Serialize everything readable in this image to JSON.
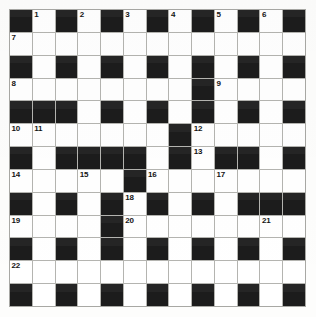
{
  "puzzle": {
    "title": "Crossword Grid",
    "type": "crossword",
    "rows": 13,
    "cols": 13,
    "colors": {
      "block": "#1c1c1c",
      "cell": "#ffffff",
      "grid_line": "#b4b4b0",
      "number": "#141414",
      "page": "#ffffff"
    },
    "legend": {
      "block_label": "blocked square",
      "cell_label": "empty answer square"
    },
    "clue_numbers": [
      1,
      2,
      3,
      4,
      5,
      6,
      7,
      8,
      9,
      10,
      11,
      12,
      13,
      14,
      15,
      16,
      17,
      18,
      19,
      20,
      21,
      22
    ],
    "grid": [
      [
        {
          "block": true
        },
        {
          "block": false,
          "num": "1"
        },
        {
          "block": true
        },
        {
          "block": false,
          "num": "2"
        },
        {
          "block": true
        },
        {
          "block": false,
          "num": "3"
        },
        {
          "block": true
        },
        {
          "block": false,
          "num": "4"
        },
        {
          "block": true
        },
        {
          "block": false,
          "num": "5"
        },
        {
          "block": true
        },
        {
          "block": false,
          "num": "6"
        },
        {
          "block": true
        }
      ],
      [
        {
          "block": false,
          "num": "7"
        },
        {
          "block": false
        },
        {
          "block": false
        },
        {
          "block": false
        },
        {
          "block": false
        },
        {
          "block": false
        },
        {
          "block": false
        },
        {
          "block": false
        },
        {
          "block": false
        },
        {
          "block": false
        },
        {
          "block": false
        },
        {
          "block": false
        },
        {
          "block": false
        }
      ],
      [
        {
          "block": true
        },
        {
          "block": false
        },
        {
          "block": true
        },
        {
          "block": false
        },
        {
          "block": true
        },
        {
          "block": false
        },
        {
          "block": true
        },
        {
          "block": false
        },
        {
          "block": true
        },
        {
          "block": false
        },
        {
          "block": true
        },
        {
          "block": false
        },
        {
          "block": true
        }
      ],
      [
        {
          "block": false,
          "num": "8"
        },
        {
          "block": false
        },
        {
          "block": false
        },
        {
          "block": false
        },
        {
          "block": false
        },
        {
          "block": false
        },
        {
          "block": false
        },
        {
          "block": false
        },
        {
          "block": true
        },
        {
          "block": false,
          "num": "9"
        },
        {
          "block": false
        },
        {
          "block": false
        },
        {
          "block": false
        }
      ],
      [
        {
          "block": true
        },
        {
          "block": true
        },
        {
          "block": true
        },
        {
          "block": false
        },
        {
          "block": true
        },
        {
          "block": false
        },
        {
          "block": true
        },
        {
          "block": false
        },
        {
          "block": true
        },
        {
          "block": false
        },
        {
          "block": true
        },
        {
          "block": false
        },
        {
          "block": true
        }
      ],
      [
        {
          "block": false,
          "num": "10"
        },
        {
          "block": false,
          "num": "11"
        },
        {
          "block": false
        },
        {
          "block": false
        },
        {
          "block": false
        },
        {
          "block": false
        },
        {
          "block": false
        },
        {
          "block": true
        },
        {
          "block": false,
          "num": "12"
        },
        {
          "block": false
        },
        {
          "block": false
        },
        {
          "block": false
        },
        {
          "block": false
        }
      ],
      [
        {
          "block": true
        },
        {
          "block": false
        },
        {
          "block": true
        },
        {
          "block": true
        },
        {
          "block": true
        },
        {
          "block": true
        },
        {
          "block": false
        },
        {
          "block": true
        },
        {
          "block": false,
          "num": "13"
        },
        {
          "block": true
        },
        {
          "block": true
        },
        {
          "block": false
        },
        {
          "block": true
        }
      ],
      [
        {
          "block": false,
          "num": "14"
        },
        {
          "block": false
        },
        {
          "block": false
        },
        {
          "block": false,
          "num": "15"
        },
        {
          "block": false
        },
        {
          "block": true
        },
        {
          "block": false,
          "num": "16"
        },
        {
          "block": false
        },
        {
          "block": false
        },
        {
          "block": false,
          "num": "17"
        },
        {
          "block": false
        },
        {
          "block": false
        },
        {
          "block": false
        }
      ],
      [
        {
          "block": true
        },
        {
          "block": false
        },
        {
          "block": true
        },
        {
          "block": false
        },
        {
          "block": true
        },
        {
          "block": false,
          "num": "18"
        },
        {
          "block": true
        },
        {
          "block": false
        },
        {
          "block": true
        },
        {
          "block": false
        },
        {
          "block": true
        },
        {
          "block": true
        },
        {
          "block": true
        }
      ],
      [
        {
          "block": false,
          "num": "19"
        },
        {
          "block": false
        },
        {
          "block": false
        },
        {
          "block": false
        },
        {
          "block": true
        },
        {
          "block": false,
          "num": "20"
        },
        {
          "block": false
        },
        {
          "block": false
        },
        {
          "block": false
        },
        {
          "block": false
        },
        {
          "block": false
        },
        {
          "block": false,
          "num": "21"
        },
        {
          "block": false
        }
      ],
      [
        {
          "block": true
        },
        {
          "block": false
        },
        {
          "block": true
        },
        {
          "block": false
        },
        {
          "block": true
        },
        {
          "block": false
        },
        {
          "block": true
        },
        {
          "block": false
        },
        {
          "block": true
        },
        {
          "block": false
        },
        {
          "block": true
        },
        {
          "block": false
        },
        {
          "block": true
        }
      ],
      [
        {
          "block": false,
          "num": "22"
        },
        {
          "block": false
        },
        {
          "block": false
        },
        {
          "block": false
        },
        {
          "block": false
        },
        {
          "block": false
        },
        {
          "block": false
        },
        {
          "block": false
        },
        {
          "block": false
        },
        {
          "block": false
        },
        {
          "block": false
        },
        {
          "block": false
        },
        {
          "block": false
        }
      ],
      [
        {
          "block": true
        },
        {
          "block": false
        },
        {
          "block": true
        },
        {
          "block": false
        },
        {
          "block": true
        },
        {
          "block": false
        },
        {
          "block": true
        },
        {
          "block": false
        },
        {
          "block": true
        },
        {
          "block": false
        },
        {
          "block": true
        },
        {
          "block": false
        },
        {
          "block": true
        }
      ]
    ]
  }
}
